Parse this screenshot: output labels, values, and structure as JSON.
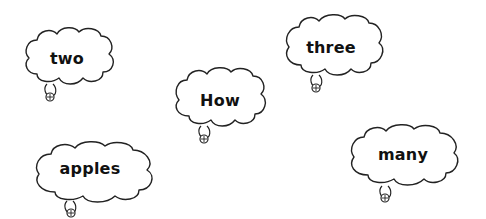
{
  "bubbles": [
    {
      "id": "two",
      "word": "two",
      "x": 23,
      "y": 26,
      "w": 92,
      "h": 58,
      "tail_x": 50,
      "tail_y": 95,
      "text_x": 67,
      "text_y": 58
    },
    {
      "id": "how",
      "word": "How",
      "x": 173,
      "y": 66,
      "w": 94,
      "h": 60,
      "tail_x": 204,
      "tail_y": 136,
      "text_x": 220,
      "text_y": 100
    },
    {
      "id": "three",
      "word": "three",
      "x": 283,
      "y": 13,
      "w": 102,
      "h": 62,
      "tail_x": 317,
      "tail_y": 86,
      "text_x": 331,
      "text_y": 47
    },
    {
      "id": "apples",
      "word": "apples",
      "x": 33,
      "y": 140,
      "w": 123,
      "h": 61,
      "tail_x": 71,
      "tail_y": 209,
      "text_x": 90,
      "text_y": 168
    },
    {
      "id": "many",
      "word": "many",
      "x": 348,
      "y": 123,
      "w": 112,
      "h": 63,
      "tail_x": 385,
      "tail_y": 194,
      "text_x": 403,
      "text_y": 154
    }
  ],
  "colors": {
    "background": "#ffffff",
    "outline": "#222222",
    "text": "#111111"
  }
}
